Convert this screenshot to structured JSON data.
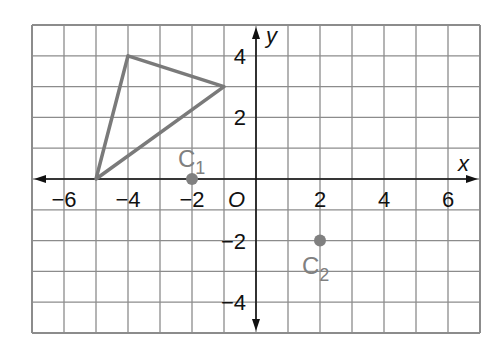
{
  "graph": {
    "axes": {
      "x_label": "x",
      "y_label": "y",
      "origin_label": "O"
    },
    "x_range": [
      -7,
      7
    ],
    "y_range": [
      -5,
      5
    ],
    "x_ticks": [
      {
        "value": -6,
        "label": "−6"
      },
      {
        "value": -4,
        "label": "−4"
      },
      {
        "value": -2,
        "label": "−2"
      },
      {
        "value": 2,
        "label": "2"
      },
      {
        "value": 4,
        "label": "4"
      },
      {
        "value": 6,
        "label": "6"
      }
    ],
    "y_ticks": [
      {
        "value": 4,
        "label": "4"
      },
      {
        "value": 2,
        "label": "2"
      },
      {
        "value": -2,
        "label": "−2"
      },
      {
        "value": -4,
        "label": "−4"
      }
    ],
    "triangle": {
      "vertices": [
        [
          -4,
          4
        ],
        [
          -1,
          3
        ],
        [
          -5,
          0
        ]
      ],
      "color": "#7a7a7a"
    },
    "points": [
      {
        "name": "C",
        "sub": "1",
        "x": -2,
        "y": 0
      },
      {
        "name": "C",
        "sub": "2",
        "x": 2,
        "y": -2
      }
    ],
    "colors": {
      "grid": "#8c8c8c",
      "axis": "#111111",
      "shape": "#7a7a7a",
      "point": "#808080",
      "label": "#111111"
    }
  }
}
